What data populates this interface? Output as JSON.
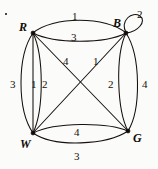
{
  "figure": {
    "kind": "multigraph-diagram",
    "background_color": "#fbfbfa",
    "ink_color": "#15100d"
  },
  "vertices": [
    {
      "id": "R",
      "label": "R",
      "x": 33,
      "y": 33,
      "label_x": 19,
      "label_y": 21
    },
    {
      "id": "B",
      "label": "B",
      "x": 126,
      "y": 33,
      "label_x": 113,
      "label_y": 17
    },
    {
      "id": "W",
      "label": "W",
      "x": 33,
      "y": 133,
      "label_x": 20,
      "label_y": 138
    },
    {
      "id": "G",
      "label": "G",
      "x": 128,
      "y": 131,
      "label_x": 133,
      "label_y": 132
    }
  ],
  "edges": [
    {
      "from": "R",
      "to": "B",
      "weight": "1",
      "shape": "arc-up",
      "label_x": 72,
      "label_y": 11
    },
    {
      "from": "R",
      "to": "B",
      "weight": "3",
      "shape": "arc-down",
      "label_x": 71,
      "label_y": 32
    },
    {
      "from": "B",
      "to": "B",
      "weight": "2",
      "shape": "self-loop",
      "label_x": 137,
      "label_y": 9
    },
    {
      "from": "R",
      "to": "W",
      "weight": "3",
      "shape": "arc-left",
      "label_x": 10,
      "label_y": 79
    },
    {
      "from": "R",
      "to": "W",
      "weight": "1",
      "shape": "straight",
      "label_x": 31,
      "label_y": 79
    },
    {
      "from": "R",
      "to": "W",
      "weight": "2",
      "shape": "arc-right",
      "label_x": 42,
      "label_y": 79
    },
    {
      "from": "B",
      "to": "G",
      "weight": "2",
      "shape": "arc-left",
      "label_x": 108,
      "label_y": 79
    },
    {
      "from": "B",
      "to": "G",
      "weight": "4",
      "shape": "arc-right",
      "label_x": 142,
      "label_y": 79
    },
    {
      "from": "R",
      "to": "G",
      "weight": "4",
      "shape": "diagonal",
      "label_x": 63,
      "label_y": 56
    },
    {
      "from": "B",
      "to": "W",
      "weight": "1",
      "shape": "diagonal",
      "label_x": 93,
      "label_y": 56
    },
    {
      "from": "W",
      "to": "G",
      "weight": "4",
      "shape": "arc-up",
      "label_x": 74,
      "label_y": 127
    },
    {
      "from": "W",
      "to": "G",
      "weight": "3",
      "shape": "arc-down",
      "label_x": 74,
      "label_y": 151
    }
  ]
}
